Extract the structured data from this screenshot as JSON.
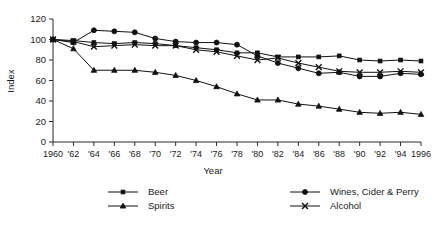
{
  "chart_data": {
    "type": "line",
    "title": "",
    "xlabel": "Year",
    "ylabel": "Index",
    "xlim": [
      1960,
      1996
    ],
    "ylim": [
      0,
      120
    ],
    "ytick_values": [
      0,
      20,
      40,
      60,
      80,
      100,
      120
    ],
    "ytick_labels": [
      "0",
      "20",
      "40",
      "60",
      "80",
      "100",
      "120"
    ],
    "grid": false,
    "legend_position": "bottom",
    "x": [
      1960,
      1962,
      1964,
      1966,
      1968,
      1970,
      1972,
      1974,
      1976,
      1978,
      1980,
      1982,
      1984,
      1986,
      1988,
      1990,
      1992,
      1994,
      1996
    ],
    "xtick_labels": [
      "1960",
      "'62",
      "'64",
      "'66",
      "'68",
      "'70",
      "'72",
      "'74",
      "'76",
      "'78",
      "'80",
      "'82",
      "'84",
      "'86",
      "'88",
      "'90",
      "'92",
      "'94",
      "1996"
    ],
    "series": [
      {
        "name": "Beer",
        "marker": "small-square",
        "values": [
          100,
          99,
          97,
          96,
          97,
          96,
          94,
          92,
          90,
          87,
          87,
          83,
          83,
          83,
          84,
          80,
          79,
          80,
          79
        ]
      },
      {
        "name": "Wines, Cider & Perry",
        "marker": "filled-circle",
        "values": [
          100,
          97,
          109,
          108,
          107,
          101,
          98,
          97,
          97,
          95,
          84,
          77,
          72,
          67,
          68,
          64,
          64,
          67,
          66
        ]
      },
      {
        "name": "Spirits",
        "marker": "triangle",
        "values": [
          100,
          91,
          70,
          70,
          70,
          68,
          65,
          60,
          54,
          47,
          41,
          41,
          37,
          35,
          32,
          29,
          28,
          29,
          27
        ]
      },
      {
        "name": "Alcohol",
        "marker": "cross-x",
        "values": [
          100,
          98,
          93,
          94,
          95,
          94,
          94,
          90,
          88,
          84,
          80,
          82,
          77,
          73,
          69,
          68,
          68,
          69,
          68
        ]
      }
    ]
  },
  "legend": {
    "entries": [
      {
        "label": "Beer",
        "marker": "small-square"
      },
      {
        "label": "Wines, Cider & Perry",
        "marker": "filled-circle"
      },
      {
        "label": "Spirits",
        "marker": "triangle"
      },
      {
        "label": "Alcohol",
        "marker": "cross-x"
      }
    ]
  },
  "colors": {
    "ink": "#111111",
    "axis": "#2b2b2b",
    "background": "#ffffff"
  }
}
